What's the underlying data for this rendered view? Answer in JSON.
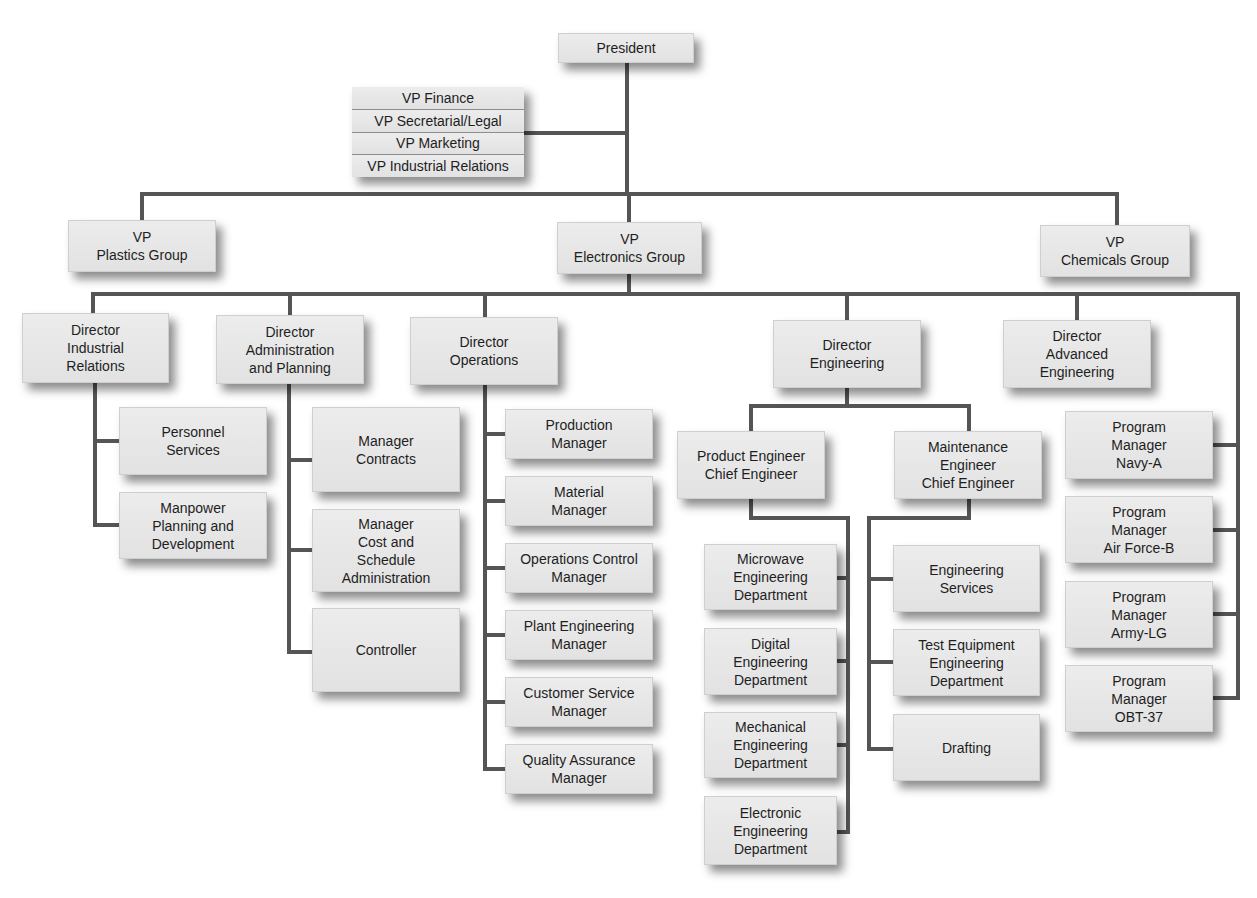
{
  "diagram": {
    "type": "org-chart",
    "line_color": "#555555",
    "box_color": "#e6e6e6",
    "president": {
      "label": "President",
      "box": [
        558,
        33,
        136,
        30
      ]
    },
    "staff_vps": {
      "box": [
        352,
        87,
        172,
        90
      ],
      "items": [
        "VP Finance",
        "VP Secretarial/Legal",
        "VP Marketing",
        "VP Industrial Relations"
      ]
    },
    "nodes": [
      {
        "id": "vp-plastics",
        "label": "VP\nPlastics Group",
        "box": [
          68,
          220,
          148,
          52
        ]
      },
      {
        "id": "vp-electronics",
        "label": "VP\nElectronics Group",
        "box": [
          557,
          222,
          145,
          52
        ]
      },
      {
        "id": "vp-chemicals",
        "label": "VP\nChemicals Group",
        "box": [
          1040,
          225,
          150,
          52
        ]
      },
      {
        "id": "dir-industrial-relations",
        "label": "Director\nIndustrial\nRelations",
        "box": [
          22,
          313,
          147,
          70
        ]
      },
      {
        "id": "dir-admin-planning",
        "label": "Director\nAdministration\nand Planning",
        "box": [
          216,
          315,
          148,
          69
        ]
      },
      {
        "id": "dir-operations",
        "label": "Director\nOperations",
        "box": [
          410,
          317,
          148,
          68
        ]
      },
      {
        "id": "dir-engineering",
        "label": "Director\nEngineering",
        "box": [
          773,
          320,
          148,
          68
        ]
      },
      {
        "id": "dir-advanced-engineering",
        "label": "Director\nAdvanced\nEngineering",
        "box": [
          1003,
          320,
          148,
          68
        ]
      },
      {
        "id": "personnel-services",
        "label": "Personnel\nServices",
        "box": [
          119,
          407,
          148,
          68
        ]
      },
      {
        "id": "manpower-planning",
        "label": "Manpower\nPlanning and\nDevelopment",
        "box": [
          119,
          492,
          148,
          67
        ]
      },
      {
        "id": "manager-contracts",
        "label": "Manager\nContracts",
        "box": [
          312,
          407,
          148,
          85
        ]
      },
      {
        "id": "manager-cost-schedule",
        "label": "Manager\nCost and\nSchedule\nAdministration",
        "box": [
          312,
          509,
          148,
          83
        ]
      },
      {
        "id": "controller",
        "label": "Controller",
        "box": [
          312,
          608,
          148,
          84
        ]
      },
      {
        "id": "production-manager",
        "label": "Production\nManager",
        "box": [
          505,
          409,
          148,
          50
        ]
      },
      {
        "id": "material-manager",
        "label": "Material\nManager",
        "box": [
          505,
          476,
          148,
          50
        ]
      },
      {
        "id": "operations-control-manager",
        "label": "Operations Control\nManager",
        "box": [
          505,
          543,
          148,
          50
        ]
      },
      {
        "id": "plant-engineering-manager",
        "label": "Plant Engineering\nManager",
        "box": [
          505,
          610,
          148,
          50
        ]
      },
      {
        "id": "customer-service-manager",
        "label": "Customer Service\nManager",
        "box": [
          505,
          677,
          148,
          50
        ]
      },
      {
        "id": "quality-assurance-manager",
        "label": "Quality Assurance\nManager",
        "box": [
          505,
          744,
          148,
          50
        ]
      },
      {
        "id": "product-engineer-chief",
        "label": "Product Engineer\nChief Engineer",
        "box": [
          677,
          431,
          148,
          68
        ]
      },
      {
        "id": "maintenance-engineer-chief",
        "label": "Maintenance\nEngineer\nChief Engineer",
        "box": [
          894,
          431,
          148,
          68
        ]
      },
      {
        "id": "microwave-eng-dept",
        "label": "Microwave\nEngineering\nDepartment",
        "box": [
          704,
          544,
          133,
          66
        ]
      },
      {
        "id": "digital-eng-dept",
        "label": "Digital\nEngineering\nDepartment",
        "box": [
          704,
          628,
          133,
          67
        ]
      },
      {
        "id": "mechanical-eng-dept",
        "label": "Mechanical\nEngineering\nDepartment",
        "box": [
          704,
          712,
          133,
          66
        ]
      },
      {
        "id": "electronic-eng-dept",
        "label": "Electronic\nEngineering\nDepartment",
        "box": [
          704,
          796,
          133,
          69
        ]
      },
      {
        "id": "engineering-services",
        "label": "Engineering\nServices",
        "box": [
          893,
          545,
          147,
          67
        ]
      },
      {
        "id": "test-equipment-eng-dept",
        "label": "Test Equipment\nEngineering\nDepartment",
        "box": [
          893,
          629,
          147,
          67
        ]
      },
      {
        "id": "drafting",
        "label": "Drafting",
        "box": [
          893,
          714,
          147,
          67
        ]
      },
      {
        "id": "pm-navy-a",
        "label": "Program\nManager\nNavy-A",
        "box": [
          1065,
          411,
          148,
          68
        ]
      },
      {
        "id": "pm-air-force-b",
        "label": "Program\nManager\nAir Force-B",
        "box": [
          1065,
          496,
          148,
          67
        ]
      },
      {
        "id": "pm-army-lg",
        "label": "Program\nManager\nArmy-LG",
        "box": [
          1065,
          581,
          148,
          67
        ]
      },
      {
        "id": "pm-obt-37",
        "label": "Program\nManager\nOBT-37",
        "box": [
          1065,
          665,
          148,
          67
        ]
      }
    ],
    "connectors": [
      "M627 63 V194",
      "M524 133 H627",
      "M142 220 V194 H1117 V225",
      "M629 194 V222",
      "M629 274 V294",
      "M93 313 V294 H1238 V698 H1213",
      "M290 294 V315",
      "M485 294 V317",
      "M847 294 V320",
      "M1077 294 V320",
      "M95 383 V525 H119",
      "M95 441 H119",
      "M289 384 V652 H312",
      "M289 460 H312",
      "M289 550 H312",
      "M485 385 V769 H505",
      "M485 434 H505",
      "M485 501 H505",
      "M485 568 H505",
      "M485 635 H505",
      "M485 702 H505",
      "M847 388 V406 H751 V431",
      "M847 406 H969 V431",
      "M751 499 V518 H848 V832 H837",
      "M837 578 H848",
      "M837 661 H848",
      "M837 745 H848",
      "M969 499 V518 H869 V749 H893",
      "M869 579 H893",
      "M869 662 H893",
      "M1213 445 H1238",
      "M1213 530 H1238",
      "M1213 614 H1238"
    ]
  }
}
